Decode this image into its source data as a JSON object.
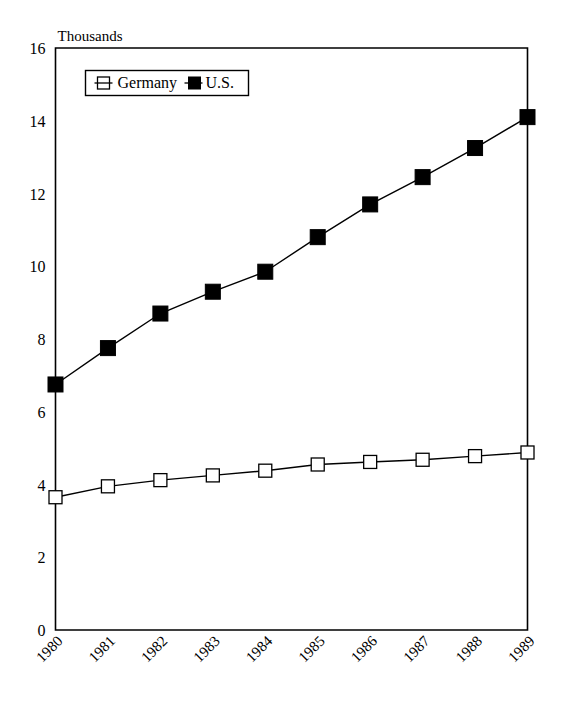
{
  "chart_data": {
    "type": "line",
    "title": "",
    "subtitle": "",
    "ylabel": "Thousands",
    "xlabel": "",
    "categories": [
      "1980",
      "1981",
      "1982",
      "1983",
      "1984",
      "1985",
      "1986",
      "1987",
      "1988",
      "1989"
    ],
    "ylim": [
      0,
      16
    ],
    "yticks": [
      0,
      2,
      4,
      6,
      8,
      10,
      12,
      14,
      16
    ],
    "ytick_labels": [
      "0",
      "2",
      "4",
      "6",
      "8",
      "10",
      "12",
      "14",
      "16"
    ],
    "grid": false,
    "legend_position": "top-left-inside",
    "series": [
      {
        "name": "Germany",
        "marker": "hollow-square",
        "color": "#000000",
        "values": [
          3.65,
          3.95,
          4.12,
          4.25,
          4.38,
          4.55,
          4.62,
          4.68,
          4.78,
          4.88
        ]
      },
      {
        "name": "U.S.",
        "marker": "filled-square",
        "color": "#000000",
        "values": [
          6.75,
          7.75,
          8.7,
          9.3,
          9.85,
          10.8,
          11.7,
          12.45,
          13.25,
          14.1
        ]
      }
    ]
  },
  "legend": {
    "entries": [
      {
        "label": "Germany",
        "marker": "hollow-square"
      },
      {
        "label": "U.S.",
        "marker": "filled-square"
      }
    ]
  },
  "axes": {
    "y_axis_title": "Thousands"
  }
}
